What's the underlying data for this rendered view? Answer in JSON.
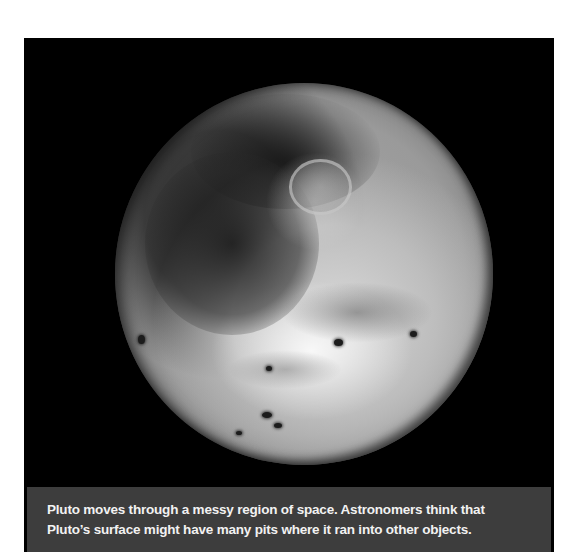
{
  "figure": {
    "subject": "Pluto",
    "background_color": "#000000",
    "caption_background": "#3d3d3d",
    "caption_text_color": "#f2f2f2",
    "caption": {
      "lines": [
        "Pluto moves through a messy region of space. Astronomers think that",
        "Pluto’s surface might have many pits where it ran into other objects."
      ]
    }
  }
}
